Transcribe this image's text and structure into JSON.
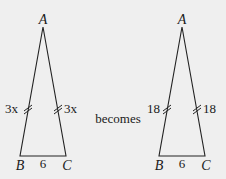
{
  "diagram": {
    "type": "isosceles-triangle-transformation",
    "connector_text": "becomes",
    "background": "#efefef",
    "line_color": "#222222",
    "triangles": [
      {
        "id": "before",
        "vertices": {
          "apex": "A",
          "bottom_left": "B",
          "bottom_right": "C"
        },
        "side_labels": {
          "left": "3x",
          "right": "3x",
          "base": "6"
        },
        "equal_side_marks": "double-tick"
      },
      {
        "id": "after",
        "vertices": {
          "apex": "A",
          "bottom_left": "B",
          "bottom_right": "C"
        },
        "side_labels": {
          "left": "18",
          "right": "18",
          "base": "6"
        },
        "equal_side_marks": "double-tick"
      }
    ]
  }
}
